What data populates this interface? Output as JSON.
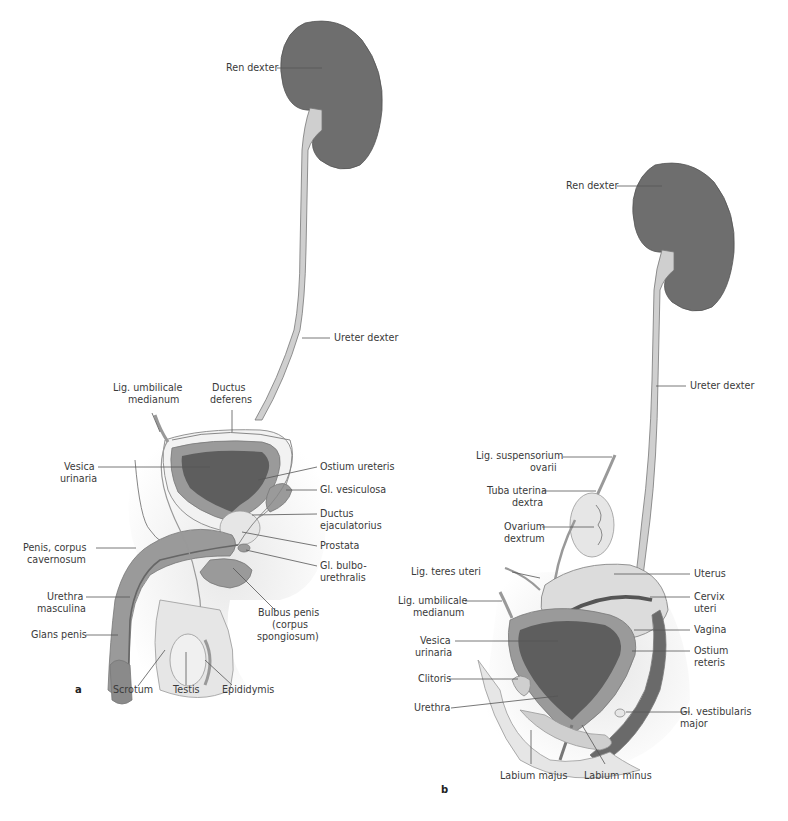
{
  "figure": {
    "panels": [
      {
        "id": "a",
        "label": "a",
        "title": "Male urinary and genital organs"
      },
      {
        "id": "b",
        "label": "b",
        "title": "Female urinary and genital organs"
      }
    ]
  },
  "colors": {
    "kidney": "#6e6e6e",
    "bladder_lumen": "#5e5e5e",
    "tissue_mid": "#9a9a9a",
    "tissue_light": "#cfcfcf",
    "tissue_pale": "#e6e6e6",
    "background_shade": "#efefef",
    "outline": "#777777",
    "label_text": "#3a3a3a"
  },
  "panel_a": {
    "labels": {
      "ren_dexter": "Ren dexter",
      "ureter_dexter": "Ureter dexter",
      "lig_umbilicale_1": "Lig. umbilicale",
      "lig_umbilicale_2": "medianum",
      "ductus_deferens_1": "Ductus",
      "ductus_deferens_2": "deferens",
      "vesica_1": "Vesica",
      "vesica_2": "urinaria",
      "ostium_ureteris": "Ostium ureteris",
      "gl_vesiculosa": "Gl. vesiculosa",
      "ductus_ejac_1": "Ductus",
      "ductus_ejac_2": "ejaculatorius",
      "prostata": "Prostata",
      "gl_bulbo_1": "Gl. bulbo-",
      "gl_bulbo_2": "urethralis",
      "penis_cc_1": "Penis, corpus",
      "penis_cc_2": "cavernosum",
      "urethra_1": "Urethra",
      "urethra_2": "masculina",
      "glans": "Glans penis",
      "bulbus_1": "Bulbus penis",
      "bulbus_2": "(corpus",
      "bulbus_3": "spongiosum)",
      "scrotum": "Scrotum",
      "testis": "Testis",
      "epididymis": "Epididymis"
    }
  },
  "panel_b": {
    "labels": {
      "ren_dexter": "Ren dexter",
      "ureter_dexter": "Ureter dexter",
      "lig_susp_1": "Lig. suspensorium",
      "lig_susp_2": "ovarii",
      "tuba_1": "Tuba uterina",
      "tuba_2": "dextra",
      "ovarium_1": "Ovarium",
      "ovarium_2": "dextrum",
      "lig_teres": "Lig. teres uteri",
      "uterus": "Uterus",
      "cervix_1": "Cervix",
      "cervix_2": "uteri",
      "lig_umbilicale_1": "Lig. umbilicale",
      "lig_umbilicale_2": "medianum",
      "vagina": "Vagina",
      "vesica_1": "Vesica",
      "vesica_2": "urinaria",
      "ostium_1": "Ostium",
      "ostium_2": "reteris",
      "clitoris": "Clitoris",
      "urethra": "Urethra",
      "gl_vest_1": "Gl. vestibularis",
      "gl_vest_2": "major",
      "labium_majus": "Labium majus",
      "labium_minus": "Labium minus"
    }
  }
}
